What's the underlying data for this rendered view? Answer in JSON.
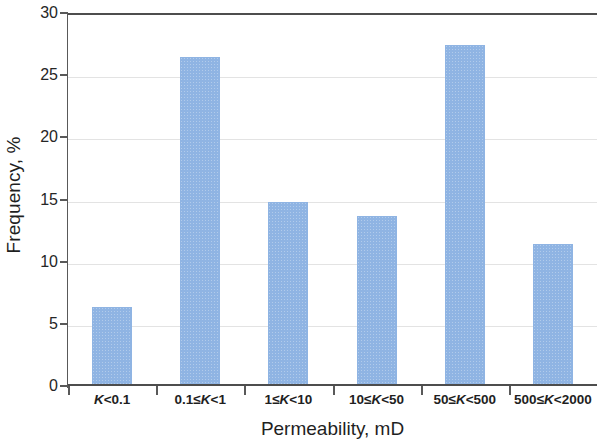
{
  "chart_data": {
    "type": "bar",
    "title": "",
    "xlabel": "Permeability, mD",
    "ylabel": "Frequency, %",
    "categories": [
      "K<0.1",
      "0.1≤K<1",
      "1≤K<10",
      "10≤K<50",
      "50≤K<500",
      "500≤K<2000"
    ],
    "values": [
      6.2,
      26.3,
      14.6,
      13.5,
      27.3,
      11.3
    ],
    "ylim": [
      0,
      30
    ],
    "ytick_labels": [
      "0",
      "5",
      "10",
      "15",
      "20",
      "25",
      "30"
    ],
    "ytick_values": [
      0,
      5,
      10,
      15,
      20,
      25,
      30
    ],
    "grid": true,
    "grid_axis": "y",
    "legend": false,
    "bar_color": "#8fb4e3",
    "axis_color": "#595959",
    "gridline_color": "#e3e3e3"
  }
}
